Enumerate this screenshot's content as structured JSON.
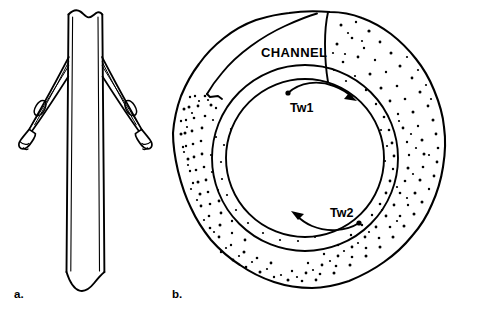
{
  "figure": {
    "type": "line-art-illustration",
    "background_color": "#ffffff",
    "ink_color": "#000000",
    "width": 480,
    "height": 313,
    "panels": [
      {
        "id": "a",
        "letter": "a.",
        "letter_position": {
          "x": 14,
          "y": 298
        },
        "description": "Longitudinal view of a tube/shaft with two splayed winged struts attached near the upper third, each strut ending in a blunt cuffed tip. Shaft is broken (wavy cut) at both top and bottom.",
        "labels": []
      },
      {
        "id": "b",
        "letter": "b.",
        "letter_position": {
          "x": 172,
          "y": 298
        },
        "description": "Cross-sectional view: irregular lumpy outer boundary enclosing a stippled wall region, a blank unstippled wedge at upper-left labelled CHANNEL, and two concentric circles forming a ring lumen. Two curved arrows inside the ring indicate opposing circulation directions.",
        "labels": [
          {
            "name": "channel",
            "text": "CHANNEL",
            "x": 261,
            "y": 57,
            "style": "uppercase-bold"
          },
          {
            "name": "tw1",
            "text": "Tw1",
            "x": 290,
            "y": 108,
            "arrow_direction": "clockwise",
            "arrow_start": "dot",
            "arrow_end": "arrowhead"
          },
          {
            "name": "tw2",
            "text": "Tw2",
            "x": 330,
            "y": 217,
            "arrow_direction": "counter-clockwise",
            "arrow_start": "dot",
            "arrow_end": "arrowhead"
          }
        ]
      }
    ]
  },
  "alt_text": "Two-panel scientific line drawing: (a) a winged tube in longitudinal view; (b) an annular cross-section with a stippled wall, a blank CHANNEL wedge, and two opposing curved flow arrows labelled Tw1 and Tw2."
}
